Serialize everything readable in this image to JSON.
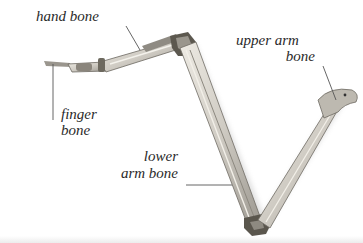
{
  "diagram": {
    "labels": [
      {
        "id": "hand",
        "text": "hand bone"
      },
      {
        "id": "finger_1",
        "text": "finger"
      },
      {
        "id": "finger_2",
        "text": "bone"
      },
      {
        "id": "upper_1",
        "text": "upper arm"
      },
      {
        "id": "upper_2",
        "text": "bone"
      },
      {
        "id": "lower_1",
        "text": "lower"
      },
      {
        "id": "lower_2",
        "text": "arm bone"
      }
    ],
    "colors": {
      "bone_light": "#e4e1da",
      "bone_mid": "#b9b5ad",
      "bone_dark": "#5a5650",
      "leader_line": "#555555",
      "text": "#2a2a2a",
      "background": "#ffffff"
    }
  }
}
